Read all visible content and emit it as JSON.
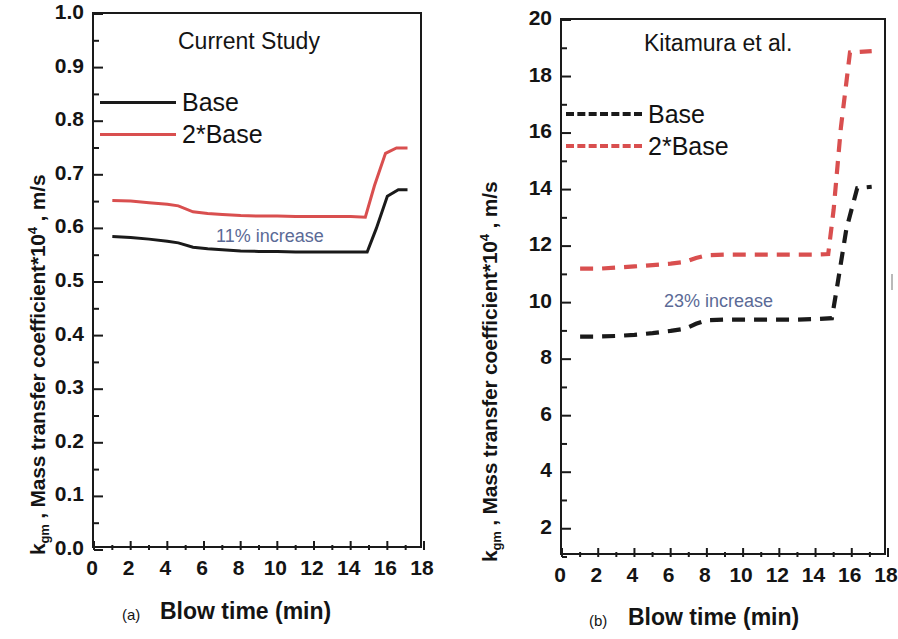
{
  "figure": {
    "background": "#ffffff",
    "series_colors": {
      "base": "#1a1a1a",
      "two_base": "#d94f4f",
      "annotation": "#5b6a96"
    }
  },
  "panels": [
    {
      "id": "a",
      "letter": "(a)",
      "title": "Current Study",
      "x_axis_title": "Blow time (min)",
      "y_axis_title_prefix": "k",
      "y_axis_title_sub": "gm",
      "y_axis_title_mid": " , Mass transfer coefficient*10",
      "y_axis_title_sup": "4",
      "y_axis_title_suffix": " , m/s",
      "annotation": "11% increase",
      "legend": [
        {
          "label": "Base",
          "color": "#1a1a1a",
          "style": "solid"
        },
        {
          "label": "2*Base",
          "color": "#d94f4f",
          "style": "solid"
        }
      ],
      "y_ticks": [
        "0.0",
        "0.1",
        "0.2",
        "0.3",
        "0.4",
        "0.5",
        "0.6",
        "0.7",
        "0.8",
        "0.9",
        "1.0"
      ],
      "x_ticks": [
        "0",
        "2",
        "4",
        "6",
        "8",
        "10",
        "12",
        "14",
        "16",
        "18"
      ]
    },
    {
      "id": "b",
      "letter": "(b)",
      "title": "Kitamura et al.",
      "x_axis_title": "Blow time (min)",
      "y_axis_title_prefix": "k",
      "y_axis_title_sub": "gm",
      "y_axis_title_mid": " , Mass transfer coefficient*10",
      "y_axis_title_sup": "4",
      "y_axis_title_suffix": " , m/s",
      "annotation": "23% increase",
      "legend": [
        {
          "label": "Base",
          "color": "#1a1a1a",
          "style": "dashed"
        },
        {
          "label": "2*Base",
          "color": "#d94f4f",
          "style": "dashed"
        }
      ],
      "y_ticks": [
        "2",
        "4",
        "6",
        "8",
        "10",
        "12",
        "14",
        "16",
        "18",
        "20"
      ],
      "x_ticks": [
        "0",
        "2",
        "4",
        "6",
        "8",
        "10",
        "12",
        "14",
        "16",
        "18"
      ]
    }
  ],
  "chart_data": [
    {
      "type": "line",
      "panel": "(a)",
      "title": "Current Study",
      "xlabel": "Blow time (min)",
      "ylabel": "k_gm , Mass transfer coefficient*10^4, m/s",
      "xlim": [
        0,
        18
      ],
      "ylim": [
        0.0,
        1.0
      ],
      "xticks": [
        0,
        2,
        4,
        6,
        8,
        10,
        12,
        14,
        16,
        18
      ],
      "yticks": [
        0.0,
        0.1,
        0.2,
        0.3,
        0.4,
        0.5,
        0.6,
        0.7,
        0.8,
        0.9,
        1.0
      ],
      "minor_ticks": true,
      "grid": false,
      "legend_position": "upper-left-inside",
      "annotations": [
        {
          "text": "11% increase",
          "x": 8.6,
          "y": 0.595,
          "color": "#5b6a96"
        }
      ],
      "series": [
        {
          "name": "Base",
          "color": "#1a1a1a",
          "style": "solid",
          "x": [
            1.0,
            2.0,
            3.0,
            4.0,
            4.6,
            5.4,
            6.2,
            7.0,
            8.0,
            9.0,
            10.0,
            11.0,
            12.0,
            13.0,
            14.0,
            14.9,
            15.4,
            16.0,
            16.6,
            17.1
          ],
          "y": [
            0.585,
            0.583,
            0.58,
            0.576,
            0.573,
            0.565,
            0.562,
            0.56,
            0.558,
            0.557,
            0.557,
            0.556,
            0.556,
            0.556,
            0.556,
            0.556,
            0.6,
            0.66,
            0.672,
            0.672
          ]
        },
        {
          "name": "2*Base",
          "color": "#d94f4f",
          "style": "solid",
          "x": [
            1.0,
            2.0,
            3.0,
            4.0,
            4.6,
            5.4,
            6.2,
            7.0,
            8.0,
            9.0,
            10.0,
            11.0,
            12.0,
            13.0,
            14.0,
            14.8,
            15.3,
            15.9,
            16.5,
            17.1
          ],
          "y": [
            0.652,
            0.651,
            0.648,
            0.645,
            0.642,
            0.631,
            0.628,
            0.626,
            0.624,
            0.623,
            0.623,
            0.622,
            0.622,
            0.622,
            0.622,
            0.621,
            0.68,
            0.74,
            0.75,
            0.75
          ]
        }
      ]
    },
    {
      "type": "line",
      "panel": "(b)",
      "title": "Kitamura et al.",
      "xlabel": "Blow time (min)",
      "ylabel": "k_gm , Mass transfer coefficient*10^4, m/s",
      "xlim": [
        0,
        18
      ],
      "ylim": [
        1.0,
        20.0
      ],
      "xticks": [
        0,
        2,
        4,
        6,
        8,
        10,
        12,
        14,
        16,
        18
      ],
      "yticks": [
        2,
        4,
        6,
        8,
        10,
        12,
        14,
        16,
        18,
        20
      ],
      "minor_ticks": true,
      "grid": false,
      "legend_position": "upper-left-inside",
      "annotations": [
        {
          "text": "23% increase",
          "x": 8.2,
          "y": 10.15,
          "color": "#5b6a96"
        }
      ],
      "series": [
        {
          "name": "Base",
          "color": "#1a1a1a",
          "style": "dashed",
          "x": [
            1.0,
            2.0,
            3.0,
            4.0,
            5.0,
            6.0,
            6.8,
            7.4,
            8.0,
            9.0,
            10.0,
            11.0,
            12.0,
            13.0,
            14.0,
            14.9,
            15.2,
            15.7,
            16.3,
            17.1
          ],
          "y": [
            8.8,
            8.8,
            8.82,
            8.86,
            8.92,
            9.0,
            9.08,
            9.25,
            9.38,
            9.4,
            9.4,
            9.4,
            9.4,
            9.4,
            9.42,
            9.45,
            10.6,
            12.6,
            14.05,
            14.1
          ]
        },
        {
          "name": "2*Base",
          "color": "#d94f4f",
          "style": "dashed",
          "x": [
            1.0,
            2.0,
            3.0,
            4.0,
            5.0,
            6.0,
            6.8,
            7.4,
            8.0,
            9.0,
            10.0,
            11.0,
            12.0,
            13.0,
            14.0,
            14.7,
            15.0,
            15.4,
            15.9,
            17.1
          ],
          "y": [
            11.2,
            11.2,
            11.24,
            11.28,
            11.33,
            11.38,
            11.44,
            11.58,
            11.68,
            11.7,
            11.7,
            11.7,
            11.7,
            11.7,
            11.7,
            11.72,
            13.3,
            16.2,
            18.85,
            18.9
          ]
        }
      ]
    }
  ]
}
